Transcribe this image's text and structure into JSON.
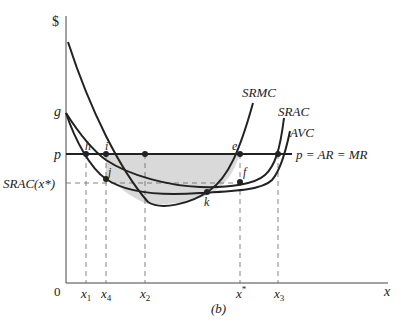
{
  "diagram": {
    "panel_label": "(b)",
    "axes": {
      "y_label": "$",
      "x_label": "x",
      "origin": "0"
    },
    "y_ticks": {
      "g": "g",
      "p": "p",
      "srac_xstar": "SRAC(x*)"
    },
    "x_ticks": [
      "x1",
      "x4",
      "x2",
      "x*",
      "x3"
    ],
    "x_tick_labels": {
      "x1_base": "x",
      "x1_sub": "1",
      "x4_base": "x",
      "x4_sub": "4",
      "x2_base": "x",
      "x2_sub": "2",
      "xstar_base": "x",
      "xstar_sup": "*",
      "x3_base": "x",
      "x3_sub": "3"
    },
    "curves": {
      "srmc": "SRMC",
      "srac": "SRAC",
      "avc": "AVC",
      "price_line": "p = AR = MR"
    },
    "points": {
      "e": "e",
      "f": "f",
      "h": "h",
      "i": "i",
      "j": "j",
      "k": "k"
    },
    "colors": {
      "ink": "#222222",
      "shade": "#d9d9d9",
      "dash": "#555555"
    }
  }
}
